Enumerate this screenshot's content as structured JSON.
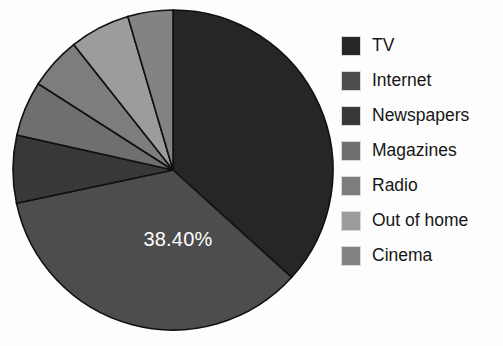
{
  "chart_data": {
    "type": "pie",
    "title": "",
    "categories": [
      "TV",
      "Internet",
      "Newspapers",
      "Magazines",
      "Radio",
      "Out of home",
      "Cinema"
    ],
    "values": [
      40.3,
      38.4,
      7.5,
      6.1,
      5.8,
      6.7,
      5.0
    ],
    "start_angle_deg": 0,
    "direction": "clockwise",
    "colors": [
      "#262626",
      "#4d4d4d",
      "#383838",
      "#6f6f6f",
      "#7d7d7d",
      "#9c9c9c",
      "#838383"
    ],
    "visible_data_labels": [
      {
        "category": "Internet",
        "text": "38.40%"
      }
    ],
    "legend_position": "right",
    "grid": false,
    "xlabel": "",
    "ylabel": ""
  },
  "legend": {
    "items": [
      {
        "label": "TV",
        "color": "#262626"
      },
      {
        "label": "Internet",
        "color": "#4d4d4d"
      },
      {
        "label": "Newspapers",
        "color": "#383838"
      },
      {
        "label": "Magazines",
        "color": "#6f6f6f"
      },
      {
        "label": "Radio",
        "color": "#7d7d7d"
      },
      {
        "label": "Out of home",
        "color": "#9c9c9c"
      },
      {
        "label": "Cinema",
        "color": "#838383"
      }
    ]
  },
  "pie": {
    "center_x": 173,
    "center_y": 170,
    "radius": 160,
    "label_text": "38.40%"
  }
}
